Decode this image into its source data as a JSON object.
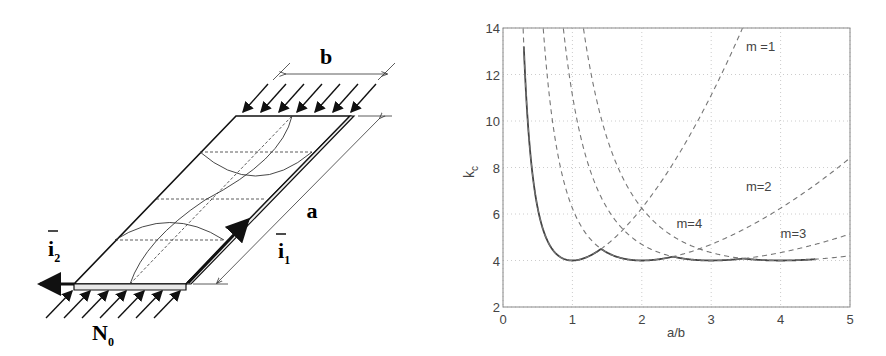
{
  "diagram": {
    "labels": {
      "b": "b",
      "a": "a",
      "i1": "i",
      "i1_sub": "1",
      "i2": "i",
      "i2_sub": "2",
      "load": "N",
      "load_sub": "0"
    },
    "top_load_arrows": 7,
    "bottom_load_arrows": 7,
    "buckle_half_waves": 2
  },
  "chart_data": {
    "type": "line",
    "title": "",
    "xlabel": "a/b",
    "ylabel": "k",
    "ylabel_sub": "c",
    "xlim": [
      0,
      5
    ],
    "ylim": [
      2,
      14
    ],
    "xticks": [
      0,
      1,
      2,
      3,
      4,
      5
    ],
    "yticks": [
      2,
      4,
      6,
      8,
      10,
      12,
      14
    ],
    "grid": true,
    "formula": "k = (m*b/a + a/(m*b))^2",
    "series": [
      {
        "name": "envelope (min over m)",
        "style": "solid",
        "x_range": [
          0.3,
          4.5
        ],
        "color": "#444444",
        "sample_points": [
          [
            0.3,
            13.2
          ],
          [
            0.5,
            6.25
          ],
          [
            0.75,
            4.34
          ],
          [
            1.0,
            4.0
          ],
          [
            1.41,
            4.5
          ],
          [
            2.0,
            4.0
          ],
          [
            2.45,
            4.17
          ],
          [
            3.0,
            4.0
          ],
          [
            3.46,
            4.08
          ],
          [
            4.0,
            4.0
          ],
          [
            4.5,
            4.05
          ]
        ]
      },
      {
        "name": "m =1",
        "m": 1,
        "style": "dashed",
        "color": "#777777",
        "sample_points": [
          [
            0.5,
            6.25
          ],
          [
            1.0,
            4.0
          ],
          [
            1.5,
            4.69
          ],
          [
            2.0,
            6.25
          ],
          [
            2.5,
            8.41
          ],
          [
            3.0,
            11.11
          ],
          [
            3.4,
            13.9
          ]
        ]
      },
      {
        "name": "m=2",
        "m": 2,
        "style": "dashed",
        "color": "#777777",
        "sample_points": [
          [
            1.0,
            6.25
          ],
          [
            2.0,
            4.0
          ],
          [
            3.0,
            4.69
          ],
          [
            4.0,
            6.25
          ],
          [
            5.0,
            8.41
          ]
        ]
      },
      {
        "name": "m=3",
        "m": 3,
        "style": "dashed",
        "color": "#777777",
        "sample_points": [
          [
            1.5,
            6.25
          ],
          [
            3.0,
            4.0
          ],
          [
            4.0,
            4.34
          ],
          [
            5.0,
            5.14
          ]
        ]
      },
      {
        "name": "m=4",
        "m": 4,
        "style": "dashed",
        "color": "#777777",
        "sample_points": [
          [
            2.0,
            6.25
          ],
          [
            3.0,
            4.34
          ],
          [
            4.0,
            4.0
          ],
          [
            5.0,
            4.1
          ]
        ]
      }
    ],
    "annotations": [
      {
        "text": "m =1",
        "x": 3.5,
        "y": 13.0
      },
      {
        "text": "m=2",
        "x": 3.5,
        "y": 7.0
      },
      {
        "text": "m=4",
        "x": 2.5,
        "y": 5.4
      },
      {
        "text": "m=3",
        "x": 4.0,
        "y": 4.95
      }
    ]
  }
}
